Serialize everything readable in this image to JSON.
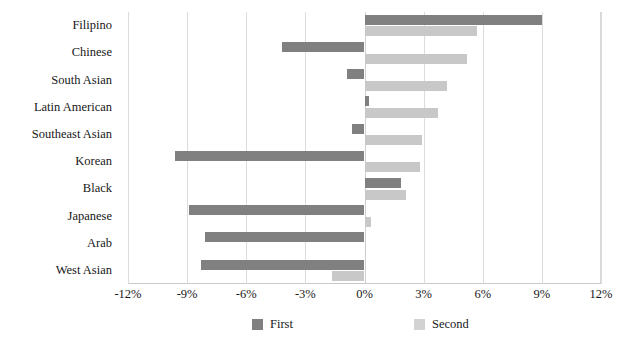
{
  "chart_data": {
    "type": "bar",
    "orientation": "horizontal",
    "title": "",
    "xlabel": "",
    "ylabel": "",
    "categories": [
      "Filipino",
      "Chinese",
      "South Asian",
      "Latin American",
      "Southeast Asian",
      "Korean",
      "Black",
      "Japanese",
      "Arab",
      "West Asian"
    ],
    "series": [
      {
        "name": "First",
        "color": "#808080",
        "values": [
          9.0,
          -4.2,
          -0.9,
          0.25,
          -0.65,
          -9.6,
          1.85,
          -8.9,
          -8.1,
          -8.3
        ]
      },
      {
        "name": "Second",
        "color": "#c8c8c8",
        "values": [
          5.7,
          5.2,
          4.2,
          3.75,
          2.9,
          2.8,
          2.1,
          0.35,
          0.1,
          -1.65
        ]
      }
    ],
    "xlim": [
      -12,
      12
    ],
    "xticks": [
      -12,
      -9,
      -6,
      -3,
      0,
      3,
      6,
      9,
      12
    ],
    "xtick_labels": [
      "-12%",
      "-9%",
      "-6%",
      "-3%",
      "0%",
      "3%",
      "6%",
      "9%",
      "12%"
    ],
    "grid": true,
    "grid_axis": "x",
    "legend_position": "bottom",
    "unit": "%"
  },
  "legend": {
    "items": [
      {
        "label": "First"
      },
      {
        "label": "Second"
      }
    ]
  }
}
